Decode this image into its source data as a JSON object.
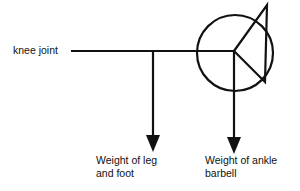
{
  "diagram": {
    "type": "free-body diagram",
    "labels": {
      "knee": "knee joint",
      "leg_line1": "Weight of leg",
      "leg_line2": "and foot",
      "ankle_line1": "Weight of ankle",
      "ankle_line2": "barbell"
    },
    "elements": [
      {
        "name": "lever-arm",
        "kind": "horizontal line"
      },
      {
        "name": "leg-weight-arrow",
        "kind": "downward arrow"
      },
      {
        "name": "barbell-weight-arrow",
        "kind": "downward arrow"
      },
      {
        "name": "barbell-circle",
        "kind": "circle"
      },
      {
        "name": "foot-triangle",
        "kind": "triangle"
      }
    ],
    "colors": {
      "stroke": "#111111",
      "background": "#ffffff"
    }
  }
}
